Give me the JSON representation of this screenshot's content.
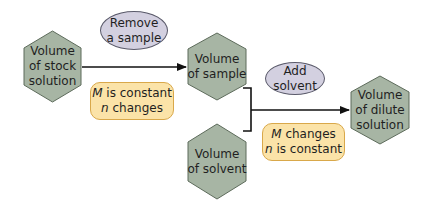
{
  "diagram": {
    "colors": {
      "hex_fill": "#a7b5a4",
      "hex_stroke": "#5d6b5b",
      "ellipse_fill": "#d3d0e0",
      "note_fill": "#fbe3a8",
      "line": "#111111"
    },
    "nodes": {
      "stock": {
        "line1": "Volume",
        "line2": "of stock",
        "line3": "solution"
      },
      "sample": {
        "line1": "Volume",
        "line2": "of sample"
      },
      "solvent": {
        "line1": "Volume",
        "line2": "of solvent"
      },
      "dilute": {
        "line1": "Volume",
        "line2": "of dilute",
        "line3": "solution"
      }
    },
    "actions": {
      "remove": {
        "line1": "Remove",
        "line2": "a sample"
      },
      "add": {
        "line1": "Add",
        "line2": "solvent"
      }
    },
    "notes": {
      "first": {
        "var1": "M",
        "rest1": " is constant",
        "var2": "n",
        "rest2": " changes"
      },
      "second": {
        "var1": "M",
        "rest1": " changes",
        "var2": "n",
        "rest2": " is constant"
      }
    }
  }
}
